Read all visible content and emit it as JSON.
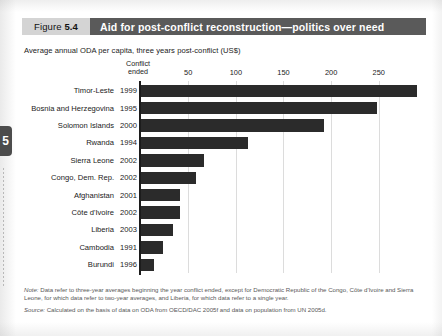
{
  "chapter_tab": {
    "label": "5"
  },
  "figure": {
    "number_prefix": "Figure",
    "number": "5.4",
    "title": "Aid for post-conflict reconstruction—politics over need",
    "subtitle": "Average annual ODA per capita, three years post-conflict (US$)",
    "column_header_line1": "Conflict",
    "column_header_line2": "ended"
  },
  "notes": {
    "note_lead": "Note:",
    "note_text": " Data refer to three-year averages beginning the year conflict ended, except for Democratic Republic of the Congo, Côte d'Ivoire and Sierra Leone, for which data refer to two-year averages, and Liberia, for which data refer to a single year.",
    "source_lead": "Source:",
    "source_text": " Calculated on the basis of data on ODA from OECD/DAC 2005f and data on population from UN 2005d."
  },
  "colors": {
    "bar": "#2b2b2b",
    "title_band": "#5a5a5a",
    "figure_number_band": "#d4d4d4",
    "axis": "#1c1c1c",
    "gridline": "#dcdcdc",
    "note_text": "#585858"
  },
  "chart_data": {
    "type": "bar",
    "orientation": "horizontal",
    "title": "Aid for post-conflict reconstruction—politics over need",
    "subtitle": "Average annual ODA per capita, three years post-conflict (US$)",
    "xlabel": "",
    "ylabel": "",
    "xlim": [
      0,
      290
    ],
    "xticks": [
      50,
      100,
      150,
      200,
      250
    ],
    "xtick_labels": [
      "50",
      "100",
      "150",
      "200",
      "250"
    ],
    "grid": true,
    "legend": null,
    "extra_column_header": "Conflict ended",
    "categories": [
      "Timor-Leste",
      "Bosnia and Herzegovina",
      "Solomon Islands",
      "Rwanda",
      "Sierra Leone",
      "Congo, Dem. Rep.",
      "Afghanistan",
      "Côte d'Ivoire",
      "Liberia",
      "Cambodia",
      "Burundi"
    ],
    "conflict_ended": [
      "1999",
      "1995",
      "2000",
      "1994",
      "2002",
      "2002",
      "2001",
      "2002",
      "2003",
      "1991",
      "1996"
    ],
    "values": [
      290,
      248,
      193,
      113,
      67,
      58,
      41,
      41,
      34,
      24,
      14
    ],
    "rows": [
      {
        "country": "Timor-Leste",
        "year": "1999",
        "value": 290
      },
      {
        "country": "Bosnia and Herzegovina",
        "year": "1995",
        "value": 248
      },
      {
        "country": "Solomon Islands",
        "year": "2000",
        "value": 193
      },
      {
        "country": "Rwanda",
        "year": "1994",
        "value": 113
      },
      {
        "country": "Sierra Leone",
        "year": "2002",
        "value": 67
      },
      {
        "country": "Congo, Dem. Rep.",
        "year": "2002",
        "value": 58
      },
      {
        "country": "Afghanistan",
        "year": "2001",
        "value": 41
      },
      {
        "country": "Côte d'Ivoire",
        "year": "2002",
        "value": 41
      },
      {
        "country": "Liberia",
        "year": "2003",
        "value": 34
      },
      {
        "country": "Cambodia",
        "year": "1991",
        "value": 24
      },
      {
        "country": "Burundi",
        "year": "1996",
        "value": 14
      }
    ]
  }
}
